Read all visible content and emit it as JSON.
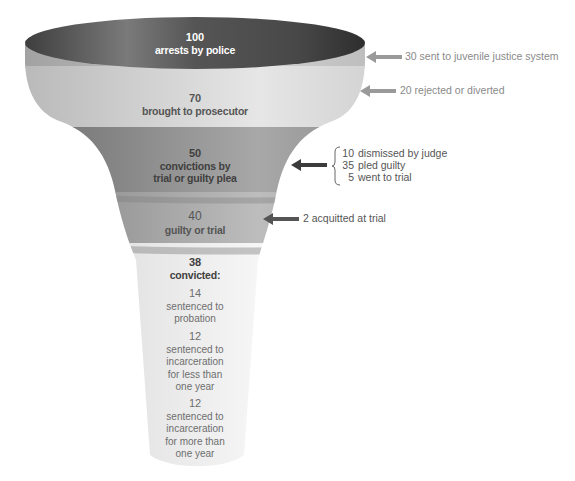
{
  "funnel": {
    "stages": [
      {
        "value": "100",
        "label": "arrests by police"
      },
      {
        "value": "70",
        "label": "brought to prosecutor"
      },
      {
        "value": "50",
        "label_line1": "convictions by",
        "label_line2": "trial or guilty plea"
      },
      {
        "value": "40",
        "label": "guilty or trial"
      },
      {
        "value": "38",
        "label": "convicted:"
      }
    ],
    "sentences": [
      {
        "value": "14",
        "lines": [
          "sentenced to",
          "probation"
        ]
      },
      {
        "value": "12",
        "lines": [
          "sentenced to",
          "incarceration",
          "for less than",
          "one year"
        ]
      },
      {
        "value": "12",
        "lines": [
          "sentenced to",
          "incarceration",
          "for more than",
          "one year"
        ]
      }
    ]
  },
  "exits": {
    "juvenile": "30 sent to juvenile justice system",
    "rejected": "20 rejected or diverted",
    "breakdown": [
      {
        "n": "10",
        "text": "dismissed by judge"
      },
      {
        "n": "35",
        "text": "pled guilty"
      },
      {
        "n": "5",
        "text": "went to trial"
      }
    ],
    "acquitted": "2 acquitted at trial"
  },
  "colors": {
    "top_dark": "#4a4a4a",
    "rim": "#b8b8b8",
    "band_light": "#d4d4d4",
    "band_dark": "#8c8c8c",
    "band_mid": "#a9a9a9",
    "band_pale": "#ececec",
    "arrow_light": "#9a9a9a",
    "arrow_dark": "#3c3c3c"
  }
}
